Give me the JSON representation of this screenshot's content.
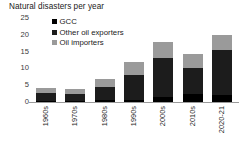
{
  "chart_data": {
    "type": "bar",
    "stacked": true,
    "title": "Natural disasters per year",
    "xlabel": "",
    "ylabel": "",
    "ylim": [
      0,
      25
    ],
    "yticks": [
      25,
      20,
      15,
      10,
      5,
      0
    ],
    "grid": false,
    "legend_position": "top-left-inside",
    "categories": [
      "1960s",
      "1970s",
      "1980s",
      "1990s",
      "2000s",
      "2010s",
      "2020-21"
    ],
    "series": [
      {
        "name": "GCC",
        "color": "#000000",
        "values": [
          0.3,
          0.3,
          0.6,
          0.5,
          1.4,
          2.4,
          2.0
        ]
      },
      {
        "name": "Other oil exporters",
        "color": "#1c1c1c",
        "values": [
          2.4,
          2.2,
          3.9,
          7.6,
          11.7,
          7.6,
          13.5
        ]
      },
      {
        "name": "Oil importers",
        "color": "#9a9a9a",
        "values": [
          1.4,
          1.5,
          2.4,
          3.8,
          4.9,
          4.4,
          4.4
        ]
      }
    ],
    "totals": [
      4.1,
      4.0,
      6.9,
      11.9,
      18.0,
      14.4,
      19.9
    ]
  },
  "legend": {
    "items": [
      {
        "label": "GCC"
      },
      {
        "label": "Other oil exporters"
      },
      {
        "label": "Oil importers"
      }
    ]
  }
}
